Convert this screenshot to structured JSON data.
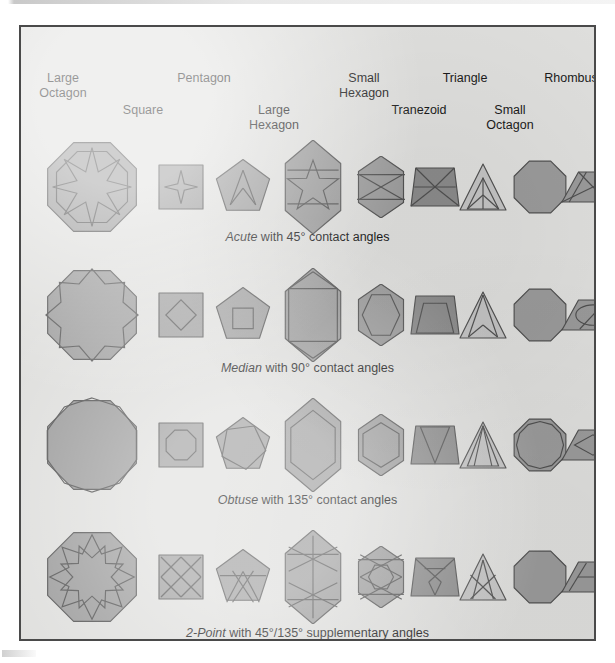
{
  "figure": {
    "background_color": "#dededc",
    "frame_border_color": "#4a4a4a",
    "shape_fill": "#9a9a9a",
    "shape_fill_dark": "#8a8a8a",
    "shape_fill_light": "#c3c3c3",
    "shape_stroke": "#4f4f4f"
  },
  "headers": [
    {
      "label": "Large\nOctagon",
      "x": 42,
      "y": 44
    },
    {
      "label": "Square",
      "x": 122,
      "y": 76
    },
    {
      "label": "Pentagon",
      "x": 183,
      "y": 44
    },
    {
      "label": "Large\nHexagon",
      "x": 253,
      "y": 76
    },
    {
      "label": "Small\nHexagon",
      "x": 343,
      "y": 44
    },
    {
      "label": "Tranezoid",
      "x": 398,
      "y": 76
    },
    {
      "label": "Triangle",
      "x": 444,
      "y": 44
    },
    {
      "label": "Small\nOctagon",
      "x": 489,
      "y": 76
    },
    {
      "label": "Rhombus",
      "x": 550,
      "y": 44
    }
  ],
  "rows": [
    {
      "name": "acute",
      "caption_lead": "Acute",
      "caption_rest": " with 45° contact angles",
      "caption_y": 203,
      "shapes_y": 120
    },
    {
      "name": "median",
      "caption_lead": "Median",
      "caption_rest": " with 90° contact angles",
      "caption_y": 334,
      "shapes_y": 248
    },
    {
      "name": "obtuse",
      "caption_lead": "Obtuse",
      "caption_rest": " with 135° contact angles",
      "caption_y": 466,
      "shapes_y": 378
    },
    {
      "name": "2point",
      "caption_lead": "2-Point",
      "caption_rest": " with 45°/135° supplementary angles",
      "caption_y": 599,
      "shapes_y": 510
    }
  ],
  "chart_data": {
    "type": "table",
    "columns": [
      "Large Octagon",
      "Square",
      "Pentagon",
      "Large Hexagon",
      "Small Hexagon",
      "Tranezoid",
      "Triangle",
      "Small Octagon",
      "Rhombus"
    ],
    "row_labels": [
      "Acute with 45° contact angles",
      "Median with 90° contact angles",
      "Obtuse with 135° contact angles",
      "2-Point with 45°/135° supplementary angles"
    ],
    "cells": [
      [
        "8-point star",
        "4-point star",
        "chevron",
        "5-point star",
        "crossed X",
        "trapezoid bands",
        "inscribed arcs",
        "plain octagon",
        "zigzag band"
      ],
      [
        "octagonal rosette",
        "inscribed diamond",
        "inscribed square",
        "hexagonal band",
        "hexagonal lens",
        "inscribed pentagon",
        "split triangle",
        "plain octagon",
        "inscribed oval"
      ],
      [
        "inscribed decagon",
        "inscribed circle",
        "inscribed pentagon",
        "inscribed lens",
        "inscribed lens",
        "inscribed trapezoid",
        "inscribed triangle",
        "inscribed rosette",
        "inscribed lens"
      ],
      [
        "interlaced X band",
        "double X",
        "crossed bands",
        "double star band",
        "double star",
        "crossed bands",
        "crossed X",
        "plain octagon",
        "offset bands"
      ]
    ]
  },
  "geometry": {
    "cells": [
      {
        "col": 0,
        "cx": 71,
        "w": 96,
        "h": 96
      },
      {
        "col": 1,
        "cx": 160,
        "w": 46,
        "h": 46
      },
      {
        "col": 2,
        "cx": 222,
        "w": 58,
        "h": 56
      },
      {
        "col": 3,
        "cx": 292,
        "w": 64,
        "h": 94
      },
      {
        "col": 4,
        "cx": 360,
        "w": 52,
        "h": 62
      },
      {
        "col": 5,
        "cx": 414,
        "w": 52,
        "h": 42
      },
      {
        "col": 6,
        "cx": 462,
        "w": 52,
        "h": 50
      },
      {
        "col": 7,
        "cx": 519,
        "w": 56,
        "h": 56
      },
      {
        "col": 8,
        "cx": 572,
        "w": 66,
        "h": 34
      }
    ]
  }
}
